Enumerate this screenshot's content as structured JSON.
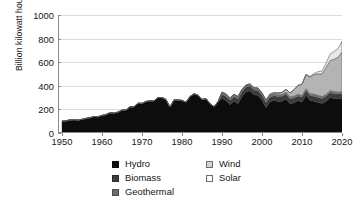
{
  "chart_data": {
    "type": "area",
    "title": "",
    "subtitle": "",
    "xlabel": "",
    "ylabel": "Billion kilowatt hours",
    "stacked": true,
    "grid": true,
    "legend_position": "bottom",
    "xlim": [
      1949,
      2020
    ],
    "ylim": [
      0,
      1000
    ],
    "ytick_labels": [
      "0",
      "200",
      "400",
      "600",
      "800",
      "1000"
    ],
    "ytick_values": [
      0,
      200,
      400,
      600,
      800,
      1000
    ],
    "xtick_labels": [
      "1950",
      "1960",
      "1970",
      "1980",
      "1990",
      "2000",
      "2010",
      "2020"
    ],
    "xtick_values": [
      1950,
      1960,
      1970,
      1980,
      1990,
      2000,
      2010,
      2020
    ],
    "x": [
      1950,
      1951,
      1952,
      1953,
      1954,
      1955,
      1956,
      1957,
      1958,
      1959,
      1960,
      1961,
      1962,
      1963,
      1964,
      1965,
      1966,
      1967,
      1968,
      1969,
      1970,
      1971,
      1972,
      1973,
      1974,
      1975,
      1976,
      1977,
      1978,
      1979,
      1980,
      1981,
      1982,
      1983,
      1984,
      1985,
      1986,
      1987,
      1988,
      1989,
      1990,
      1991,
      1992,
      1993,
      1994,
      1995,
      1996,
      1997,
      1998,
      1999,
      2000,
      2001,
      2002,
      2003,
      2004,
      2005,
      2006,
      2007,
      2008,
      2009,
      2010,
      2011,
      2012,
      2013,
      2014,
      2015,
      2016,
      2017,
      2018,
      2019,
      2020
    ],
    "series": [
      {
        "name": "Hydro",
        "color": "#0d0d0d",
        "values": [
          101,
          104,
          111,
          113,
          109,
          116,
          124,
          130,
          140,
          138,
          149,
          156,
          172,
          169,
          177,
          194,
          195,
          222,
          222,
          253,
          251,
          267,
          273,
          272,
          301,
          300,
          284,
          220,
          281,
          280,
          276,
          261,
          309,
          332,
          321,
          284,
          291,
          250,
          223,
          265,
          293,
          276,
          240,
          269,
          248,
          310,
          347,
          356,
          323,
          319,
          276,
          217,
          264,
          275,
          268,
          270,
          289,
          248,
          255,
          273,
          260,
          319,
          276,
          269,
          259,
          249,
          267,
          300,
          292,
          288,
          291
        ]
      },
      {
        "name": "Biomass",
        "color": "#3c3c3c",
        "values": [
          0,
          0,
          0,
          0,
          0,
          0,
          0,
          0,
          0,
          0,
          0,
          0,
          0,
          0,
          0,
          0,
          0,
          0,
          0,
          0,
          0,
          0,
          0,
          0,
          0,
          0,
          0,
          0,
          0,
          0,
          0,
          0,
          0,
          0,
          0,
          0,
          0,
          0,
          0,
          0,
          34,
          36,
          38,
          39,
          41,
          42,
          43,
          43,
          42,
          42,
          43,
          41,
          41,
          41,
          41,
          41,
          41,
          42,
          42,
          41,
          42,
          42,
          42,
          43,
          45,
          44,
          44,
          43,
          43,
          42,
          42
        ]
      },
      {
        "name": "Geothermal",
        "color": "#6e6e6e",
        "values": [
          0,
          0,
          0,
          0,
          0,
          0,
          0,
          0,
          0,
          0,
          0,
          0,
          0,
          0,
          0,
          0,
          0,
          0,
          0,
          0,
          0,
          0,
          0,
          0,
          0,
          0,
          0,
          0,
          0,
          0,
          0,
          0,
          0,
          0,
          0,
          0,
          0,
          0,
          0,
          0,
          16,
          16,
          16,
          17,
          16,
          14,
          14,
          14,
          15,
          15,
          14,
          14,
          14,
          14,
          15,
          15,
          15,
          15,
          15,
          15,
          15,
          15,
          15,
          16,
          16,
          16,
          16,
          16,
          16,
          16,
          16
        ]
      },
      {
        "name": "Wind",
        "color": "#b4b4b4",
        "values": [
          0,
          0,
          0,
          0,
          0,
          0,
          0,
          0,
          0,
          0,
          0,
          0,
          0,
          0,
          0,
          0,
          0,
          0,
          0,
          0,
          0,
          0,
          0,
          0,
          0,
          0,
          0,
          0,
          0,
          0,
          0,
          0,
          0,
          0,
          0,
          0,
          0,
          0,
          0,
          0,
          3,
          3,
          3,
          3,
          4,
          3,
          3,
          3,
          3,
          5,
          6,
          7,
          10,
          11,
          14,
          18,
          26,
          34,
          55,
          74,
          95,
          120,
          141,
          168,
          182,
          191,
          227,
          254,
          273,
          296,
          338
        ]
      },
      {
        "name": "Solar",
        "color": "#e8e8e8",
        "values": [
          0,
          0,
          0,
          0,
          0,
          0,
          0,
          0,
          0,
          0,
          0,
          0,
          0,
          0,
          0,
          0,
          0,
          0,
          0,
          0,
          0,
          0,
          0,
          0,
          0,
          0,
          0,
          0,
          0,
          0,
          0,
          0,
          0,
          0,
          0,
          0,
          0,
          0,
          0,
          0,
          1,
          1,
          1,
          1,
          1,
          1,
          1,
          1,
          1,
          1,
          1,
          1,
          1,
          1,
          1,
          1,
          1,
          1,
          1,
          1,
          1,
          2,
          4,
          9,
          18,
          25,
          37,
          54,
          67,
          72,
          91
        ]
      }
    ]
  },
  "legend": {
    "columns": [
      {
        "items": [
          {
            "label": "Hydro",
            "color": "#0d0d0d",
            "border": "#0d0d0d"
          },
          {
            "label": "Biomass",
            "color": "#3c3c3c",
            "border": "#2a2a2a"
          },
          {
            "label": "Geothermal",
            "color": "#6e6e6e",
            "border": "#4a4a4a"
          }
        ]
      },
      {
        "items": [
          {
            "label": "Wind",
            "color": "#d4d4d4",
            "border": "#6b6b6b"
          },
          {
            "label": "Solar",
            "color": "#fbfbfb",
            "border": "#6b6b6b"
          }
        ]
      }
    ]
  }
}
